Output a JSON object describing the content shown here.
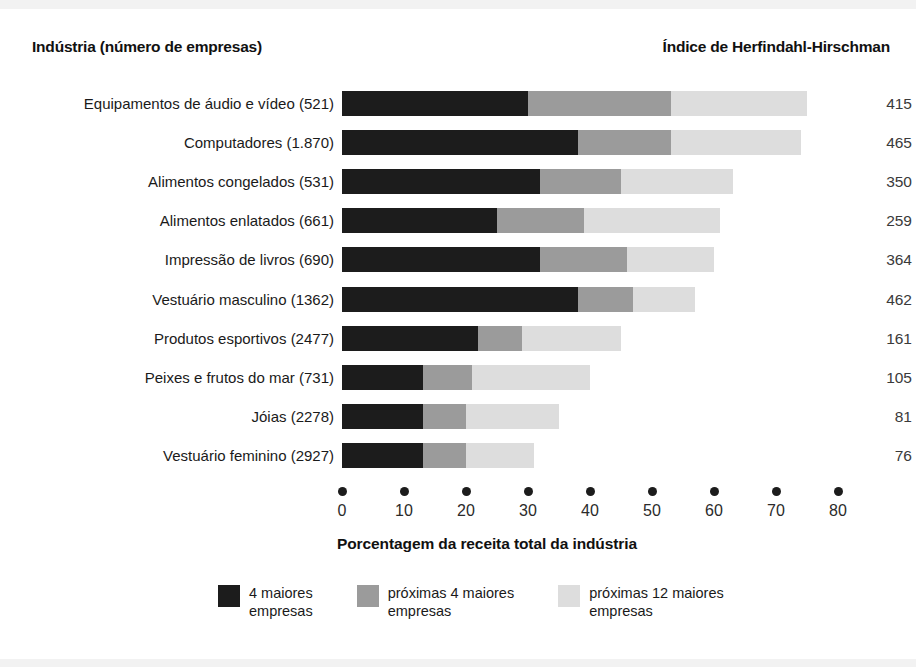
{
  "headers": {
    "left": "Indústria (número de empresas)",
    "right": "Índice de Herfindahl-Hirschman"
  },
  "chart_data": {
    "type": "bar",
    "orientation": "horizontal",
    "stacked": true,
    "title": "",
    "xlabel": "Porcentagem da receita total da indústria",
    "ylabel": "Indústria (número de empresas)",
    "xlim": [
      0,
      80
    ],
    "xticks": [
      0,
      10,
      20,
      30,
      40,
      50,
      60,
      70,
      80
    ],
    "grid": false,
    "legend_position": "bottom",
    "categories": [
      "Equipamentos de áudio e vídeo (521)",
      "Computadores (1.870)",
      "Alimentos congelados  (531)",
      "Alimentos enlatados  (661)",
      "Impressão de livros  (690)",
      "Vestuário masculino  (1362)",
      "Produtos esportivos  (2477)",
      "Peixes e frutos do mar  (731)",
      "Jóias  (2278)",
      "Vestuário feminino  (2927)"
    ],
    "series": [
      {
        "name": "4 maiores empresas",
        "color": "#1c1c1c",
        "values": [
          30,
          38,
          32,
          25,
          32,
          38,
          22,
          13,
          13,
          13
        ]
      },
      {
        "name": "próximas 4 maiores empresas",
        "color": "#9b9b9b",
        "values": [
          23,
          15,
          13,
          14,
          14,
          9,
          7,
          8,
          7,
          7
        ]
      },
      {
        "name": "próximas 12 maiores empresas",
        "color": "#dddddd",
        "values": [
          22,
          21,
          18,
          22,
          14,
          10,
          16,
          19,
          15,
          11
        ]
      }
    ],
    "totals": [
      75,
      74,
      63,
      61,
      60,
      57,
      45,
      40,
      35,
      31
    ],
    "annotations": {
      "right_axis_label": "Índice de Herfindahl-Hirschman",
      "right_values": [
        415,
        465,
        350,
        259,
        364,
        462,
        161,
        105,
        81,
        76
      ]
    }
  },
  "legend": [
    {
      "swatch": "k1",
      "line1": "4 maiores",
      "line2": "empresas"
    },
    {
      "swatch": "k2",
      "line1": "próximas 4 maiores",
      "line2": "empresas"
    },
    {
      "swatch": "k3",
      "line1": "próximas 12 maiores",
      "line2": "empresas"
    }
  ],
  "axis": {
    "title": "Porcentagem da receita total da indústria",
    "ticks": [
      "0",
      "10",
      "20",
      "30",
      "40",
      "50",
      "60",
      "70",
      "80"
    ]
  }
}
